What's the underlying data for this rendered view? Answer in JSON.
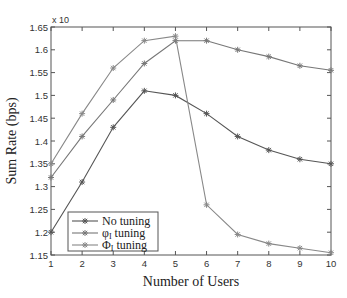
{
  "chart_data": {
    "type": "line",
    "title": "",
    "xlabel": "Number of Users",
    "ylabel": "Sum Rate (bps)",
    "y_multiplier_label": "x 10",
    "xlim": [
      1,
      10
    ],
    "ylim": [
      1.15,
      1.65
    ],
    "x": [
      1,
      2,
      3,
      4,
      5,
      6,
      7,
      8,
      9,
      10
    ],
    "xticks": [
      "1",
      "2",
      "3",
      "4",
      "5",
      "6",
      "7",
      "8",
      "9",
      "10"
    ],
    "yticks": [
      "1.15",
      "1.2",
      "1.25",
      "1.3",
      "1.35",
      "1.4",
      "1.45",
      "1.5",
      "1.55",
      "1.6",
      "1.65"
    ],
    "grid": false,
    "legend_position": "lower left",
    "series": [
      {
        "name": "No tuning",
        "label_main": "No tuning",
        "label_sub": "",
        "label_suffix": "",
        "color": "#555555",
        "values": [
          1.2,
          1.31,
          1.43,
          1.51,
          1.5,
          1.46,
          1.41,
          1.38,
          1.36,
          1.35
        ]
      },
      {
        "name": "φI tuning",
        "label_main": "φ",
        "label_sub": "I",
        "label_suffix": " tuning",
        "color": "#777777",
        "values": [
          1.32,
          1.41,
          1.49,
          1.57,
          1.62,
          1.62,
          1.6,
          1.585,
          1.565,
          1.555
        ]
      },
      {
        "name": "ΦI tuning",
        "label_main": "Φ",
        "label_sub": "I",
        "label_suffix": " tuning",
        "color": "#888888",
        "values": [
          1.35,
          1.46,
          1.56,
          1.62,
          1.63,
          1.26,
          1.195,
          1.175,
          1.165,
          1.155
        ]
      }
    ]
  }
}
